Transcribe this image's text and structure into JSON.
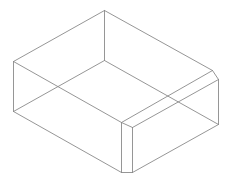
{
  "diagram": {
    "type": "wireframe-3d-box",
    "stroke_color": "#8a8a8a",
    "background": "#ffffff",
    "edges": [
      {
        "name": "top-left-edge",
        "x1": 13,
        "y1": 61,
        "x2": 104,
        "y2": 10
      },
      {
        "name": "top-back-right-edge",
        "x1": 104,
        "y1": 10,
        "x2": 212,
        "y2": 70
      },
      {
        "name": "top-front-left-edge",
        "x1": 13,
        "y1": 61,
        "x2": 121,
        "y2": 122
      },
      {
        "name": "top-front-right-edge",
        "x1": 121,
        "y1": 122,
        "x2": 212,
        "y2": 70
      },
      {
        "name": "chamfer-top-front",
        "x1": 121,
        "y1": 122,
        "x2": 132,
        "y2": 127
      },
      {
        "name": "chamfer-top-right",
        "x1": 212,
        "y1": 70,
        "x2": 218,
        "y2": 79
      },
      {
        "name": "chamfer-face-top-edge",
        "x1": 132,
        "y1": 127,
        "x2": 218,
        "y2": 79
      },
      {
        "name": "back-vertical-edge",
        "x1": 104,
        "y1": 10,
        "x2": 104,
        "y2": 60
      },
      {
        "name": "left-vertical-edge",
        "x1": 13,
        "y1": 61,
        "x2": 13,
        "y2": 111
      },
      {
        "name": "front-vertical-edge-a",
        "x1": 121,
        "y1": 122,
        "x2": 121,
        "y2": 172
      },
      {
        "name": "front-vertical-edge-b",
        "x1": 132,
        "y1": 127,
        "x2": 132,
        "y2": 172
      },
      {
        "name": "right-vertical-edge",
        "x1": 218,
        "y1": 79,
        "x2": 218,
        "y2": 124
      },
      {
        "name": "bottom-back-left-edge",
        "x1": 13,
        "y1": 111,
        "x2": 104,
        "y2": 60
      },
      {
        "name": "bottom-back-right-edge",
        "x1": 104,
        "y1": 60,
        "x2": 218,
        "y2": 124
      },
      {
        "name": "bottom-front-left-edge",
        "x1": 13,
        "y1": 111,
        "x2": 121,
        "y2": 172
      },
      {
        "name": "bottom-chamfer-edge",
        "x1": 121,
        "y1": 172,
        "x2": 132,
        "y2": 172
      },
      {
        "name": "bottom-front-right-edge",
        "x1": 132,
        "y1": 172,
        "x2": 218,
        "y2": 124
      }
    ]
  }
}
